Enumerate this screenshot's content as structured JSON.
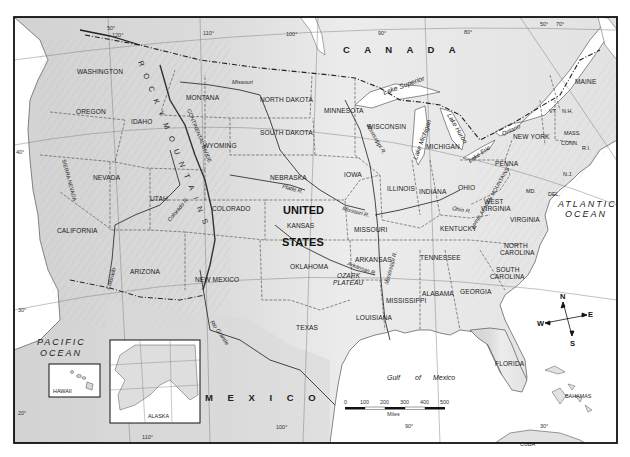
{
  "map": {
    "title": "United States physical map",
    "countries": {
      "canada": "C A N A D A",
      "mexico": "M E X I C O",
      "united_states_line1": "UNITED",
      "united_states_line2": "STATES",
      "cuba": "CUBA",
      "bahamas": "BAHAMAS"
    },
    "oceans": {
      "pacific_line1": "PACIFIC",
      "pacific_line2": "OCEAN",
      "atlantic_line1": "ATLANTIC",
      "atlantic_line2": "OCEAN",
      "gulf_1": "Gulf",
      "gulf_2": "of",
      "gulf_3": "Mexico"
    },
    "states": {
      "washington": "WASHINGTON",
      "oregon": "OREGON",
      "idaho": "IDAHO",
      "montana": "MONTANA",
      "north_dakota": "NORTH DAKOTA",
      "south_dakota": "SOUTH DAKOTA",
      "minnesota": "MINNESOTA",
      "wisconsin": "WISCONSIN",
      "michigan": "MICHIGAN",
      "wyoming": "WYOMING",
      "nevada": "NEVADA",
      "utah": "UTAH",
      "colorado": "COLORADO",
      "california": "CALIFORNIA",
      "nebraska": "NEBRASKA",
      "iowa": "IOWA",
      "illinois": "ILLINOIS",
      "indiana": "INDIANA",
      "ohio": "OHIO",
      "penna": "PENNA",
      "new_york": "NEW YORK",
      "kansas": "KANSAS",
      "missouri": "MISSOURI",
      "kentucky": "KENTUCKY",
      "west_virginia_1": "WEST",
      "west_virginia_2": "VIRGINIA",
      "virginia": "VIRGINIA",
      "arizona": "ARIZONA",
      "new_mexico": "NEW MEXICO",
      "oklahoma": "OKLAHOMA",
      "arkansas": "ARKANSAS",
      "tennessee": "TENNESSEE",
      "north_carolina_1": "NORTH",
      "north_carolina_2": "CAROLINA",
      "south_carolina_1": "SOUTH",
      "south_carolina_2": "CAROLINA",
      "texas": "TEXAS",
      "louisiana": "LOUISIANA",
      "mississippi": "MISSISSIPPI",
      "alabama": "ALABAMA",
      "georgia": "GEORGIA",
      "florida": "FLORIDA",
      "maine": "MAINE",
      "vt": "VT.",
      "nh": "N.H.",
      "mass": "MASS.",
      "conn": "CONN.",
      "ri": "R.I.",
      "nj": "N.J.",
      "md": "MD.",
      "del": "DEL.",
      "alaska": "ALASKA",
      "hawaii": "HAWAII"
    },
    "physical": {
      "ozark_1": "OZARK",
      "ozark_2": "PLATEAU",
      "rocky_mountains": "R O C K Y   M O U N T A I N S",
      "appalachian": "APPALACHIAN MOUNTAINS",
      "sierra_nevada": "SIERRA NEVADA",
      "continental_divide": "CONTINENTAL DIVIDE"
    },
    "water": {
      "lake_superior": "Lake Superior",
      "lake_michigan": "Lake Michigan",
      "lake_huron": "Lake Huron",
      "lake_erie": "Lake Erie",
      "lake_ontario": "Ontario",
      "missouri_r_north": "Missouri",
      "missouri_r": "Missouri R.",
      "mississippi_r_north": "Mississippi R.",
      "mississippi_r_south": "Mississippi R.",
      "platte_r": "Platte R.",
      "arkansas_r": "Arkansas R.",
      "ohio_r": "Ohio R.",
      "colorado_r_north": "Colorado R.",
      "colorado_r_south": "Colorado",
      "rio_grande": "Rio Grande"
    },
    "coordinates": {
      "lat_50_w": "50°",
      "lat_50_e": "50°",
      "lat_40_w": "40°",
      "lat_40_e": "40°",
      "lat_30": "30°",
      "lat_30_e": "30°",
      "lat_20": "20°",
      "lon_120": "120°",
      "lon_110_top": "110°",
      "lon_100_top": "100°",
      "lon_90_top": "90°",
      "lon_80": "80°",
      "lon_70": "70°",
      "lon_110_bottom": "110°",
      "lon_100_bottom": "100°",
      "lon_90_bottom": "90°"
    },
    "scale_bar": {
      "ticks": [
        "0",
        "100",
        "200",
        "300",
        "400",
        "500"
      ],
      "unit": "Miles"
    },
    "compass": {
      "n": "N",
      "s": "S",
      "e": "E",
      "w": "W"
    },
    "colors": {
      "land": "#e6e6e6",
      "land_shade": "#cfcfcf",
      "water": "#ffffff",
      "frame": "#111111",
      "border": "#444444"
    }
  }
}
